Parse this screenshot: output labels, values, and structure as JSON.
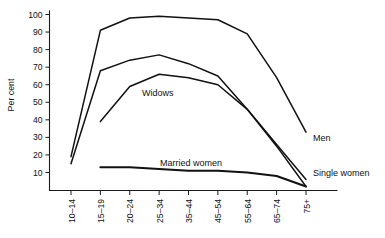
{
  "chart_data": {
    "type": "line",
    "title": "",
    "xlabel": "",
    "ylabel": "Per cent",
    "categories": [
      "10–14",
      "15–19",
      "20–24",
      "25–34",
      "35–44",
      "45–54",
      "55–64",
      "65–74",
      "75+"
    ],
    "ylim": [
      0,
      100
    ],
    "yticks": [
      10,
      20,
      30,
      40,
      50,
      60,
      70,
      80,
      90,
      100
    ],
    "grid": false,
    "legend_position": "inline-annotations",
    "series": [
      {
        "name": "Men",
        "label": "Men",
        "values": [
          19,
          91,
          98,
          99,
          98,
          97,
          89,
          64,
          33
        ]
      },
      {
        "name": "Single women",
        "label": "Single women",
        "values": [
          15,
          68,
          74,
          77,
          72,
          65,
          46,
          26,
          6
        ]
      },
      {
        "name": "Widows",
        "label": "Widows",
        "values": [
          null,
          39,
          59,
          66,
          64,
          60,
          46,
          25,
          2
        ]
      },
      {
        "name": "Married women",
        "label": "Married women",
        "values": [
          null,
          13,
          13,
          12,
          11,
          11,
          10,
          8,
          2
        ]
      }
    ]
  },
  "axes": {
    "y_title": "Per cent",
    "y_tick_labels": [
      "100",
      "90",
      "80",
      "70",
      "60",
      "50",
      "40",
      "30",
      "20",
      "10"
    ],
    "x_tick_labels": [
      "10–14",
      "15–19",
      "20–24",
      "25–34",
      "35–44",
      "45–54",
      "55–64",
      "65–74",
      "75+"
    ]
  },
  "annotations": {
    "widows": "Widows",
    "married_women": "Married women",
    "men": "Men",
    "single_women": "Single women"
  },
  "colors": {
    "line": "#111111",
    "axis": "#1a1a1a",
    "background": "#ffffff"
  }
}
